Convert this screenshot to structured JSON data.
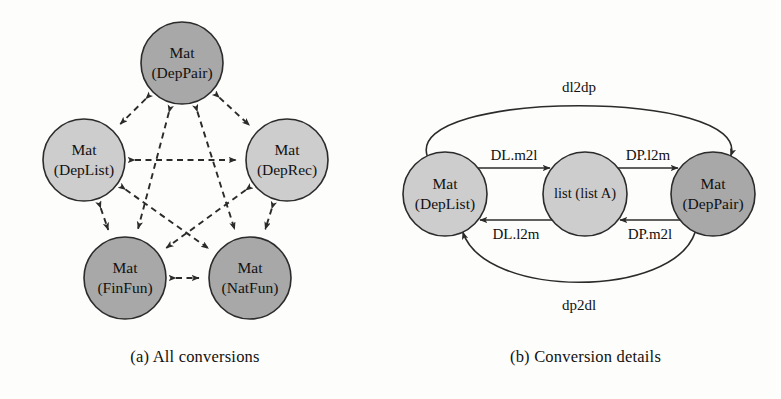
{
  "figure": {
    "background_color": "#fdfdfb",
    "stroke_color": "#2b2b2b"
  },
  "colors": {
    "node_light": "#cdcdcd",
    "node_dark": "#a8a8a8",
    "outline": "#2b2b2b",
    "text": "#111111"
  },
  "panel_a": {
    "caption": "(a) All conversions",
    "nodes": [
      {
        "id": "deppair",
        "line1": "Mat",
        "line2": "(DepPair)",
        "cx": 182,
        "cy": 63,
        "r": 41,
        "fill": "#a8a8a8"
      },
      {
        "id": "deplist",
        "line1": "Mat",
        "line2": "(DepList)",
        "cx": 84,
        "cy": 160,
        "r": 41,
        "fill": "#cdcdcd"
      },
      {
        "id": "deprec",
        "line1": "Mat",
        "line2": "(DepRec)",
        "cx": 287,
        "cy": 160,
        "r": 41,
        "fill": "#cdcdcd"
      },
      {
        "id": "finfun",
        "line1": "Mat",
        "line2": "(FinFun)",
        "cx": 125,
        "cy": 278,
        "r": 41,
        "fill": "#a8a8a8"
      },
      {
        "id": "natfun",
        "line1": "Mat",
        "line2": "(NatFun)",
        "cx": 250,
        "cy": 278,
        "r": 41,
        "fill": "#a8a8a8"
      }
    ],
    "edges": [
      {
        "from": "deppair",
        "to": "deplist",
        "style": "dashed",
        "arrows": "both"
      },
      {
        "from": "deppair",
        "to": "deprec",
        "style": "dashed",
        "arrows": "both"
      },
      {
        "from": "deppair",
        "to": "finfun",
        "style": "dashed",
        "arrows": "both"
      },
      {
        "from": "deppair",
        "to": "natfun",
        "style": "dashed",
        "arrows": "both"
      },
      {
        "from": "deplist",
        "to": "deprec",
        "style": "dashed",
        "arrows": "both"
      },
      {
        "from": "deplist",
        "to": "finfun",
        "style": "dashed",
        "arrows": "both"
      },
      {
        "from": "deplist",
        "to": "natfun",
        "style": "dashed",
        "arrows": "both"
      },
      {
        "from": "deprec",
        "to": "finfun",
        "style": "dashed",
        "arrows": "both"
      },
      {
        "from": "deprec",
        "to": "natfun",
        "style": "dashed",
        "arrows": "both"
      },
      {
        "from": "finfun",
        "to": "natfun",
        "style": "dashed",
        "arrows": "both"
      }
    ]
  },
  "panel_b": {
    "caption": "(b) Conversion details",
    "nodes": [
      {
        "id": "b-deplist",
        "line1": "Mat",
        "line2": "(DepList)",
        "cx": 55,
        "cy": 194,
        "r": 42,
        "fill": "#cdcdcd"
      },
      {
        "id": "b-list",
        "line1": "",
        "line2": "list (list A)",
        "cx": 195,
        "cy": 194,
        "r": 42,
        "fill": "#cdcdcd"
      },
      {
        "id": "b-deppair",
        "line1": "Mat",
        "line2": "(DepPair)",
        "cx": 323,
        "cy": 194,
        "r": 42,
        "fill": "#a8a8a8"
      }
    ],
    "edges": [
      {
        "id": "dl-m2l",
        "label": "DL.m2l",
        "from": "b-deplist",
        "to": "b-list",
        "style": "solid",
        "arrows": "end"
      },
      {
        "id": "dp-l2m",
        "label": "DP.l2m",
        "from": "b-list",
        "to": "b-deppair",
        "style": "solid",
        "arrows": "end"
      },
      {
        "id": "dl-l2m",
        "label": "DL.l2m",
        "from": "b-list",
        "to": "b-deplist",
        "style": "solid",
        "arrows": "end"
      },
      {
        "id": "dp-m2l",
        "label": "DP.m2l",
        "from": "b-deppair",
        "to": "b-list",
        "style": "solid",
        "arrows": "end"
      },
      {
        "id": "dl2dp",
        "label": "dl2dp",
        "from": "b-deplist",
        "to": "b-deppair",
        "style": "curve-top",
        "arrows": "end"
      },
      {
        "id": "dp2dl",
        "label": "dp2dl",
        "from": "b-deppair",
        "to": "b-deplist",
        "style": "curve-bottom",
        "arrows": "end"
      }
    ]
  }
}
